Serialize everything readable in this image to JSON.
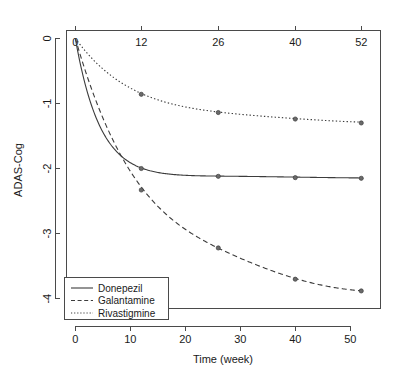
{
  "chart_data": {
    "type": "line",
    "title": "",
    "xlabel": "Time (week)",
    "ylabel": "ADAS-Cog",
    "xlim": [
      -1.6,
      55.5
    ],
    "ylim": [
      -4.15,
      0.12
    ],
    "grid": false,
    "legend_position": "bottom-left",
    "x_ticks_bottom": [
      "0",
      "10",
      "20",
      "30",
      "40",
      "50"
    ],
    "x_tick_values_bottom": [
      0,
      10,
      20,
      30,
      40,
      50
    ],
    "x_ticks_top": [
      "0",
      "12",
      "26",
      "40",
      "52"
    ],
    "x_tick_values_top": [
      0,
      12,
      26,
      40,
      52
    ],
    "y_ticks": [
      "0",
      "-1",
      "-2",
      "-3",
      "-4"
    ],
    "y_tick_values": [
      0,
      -1,
      -2,
      -3,
      -4
    ],
    "x_marker_values": [
      0,
      12,
      26,
      40,
      52
    ],
    "series": [
      {
        "name": "Donepezil",
        "style": "solid",
        "x": [
          0,
          12,
          26,
          40,
          52
        ],
        "values": [
          0,
          -2.0,
          -2.12,
          -2.14,
          -2.15
        ]
      },
      {
        "name": "Galantamine",
        "style": "dashed",
        "x": [
          0,
          12,
          26,
          40,
          52
        ],
        "values": [
          0,
          -2.33,
          -3.22,
          -3.7,
          -3.88
        ]
      },
      {
        "name": "Rivastigmine",
        "style": "dotted",
        "x": [
          0,
          12,
          26,
          40,
          52
        ],
        "values": [
          0,
          -0.86,
          -1.14,
          -1.24,
          -1.3
        ]
      }
    ]
  },
  "legend": {
    "entries": [
      {
        "label": "Donepezil",
        "style": "solid"
      },
      {
        "label": "Galantamine",
        "style": "dashed"
      },
      {
        "label": "Rivastigmine",
        "style": "dotted"
      }
    ]
  }
}
